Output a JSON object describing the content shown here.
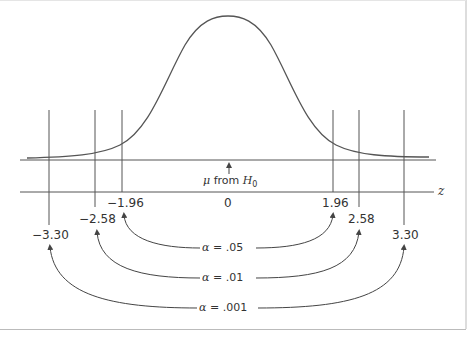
{
  "figure": {
    "axis_label": "z",
    "center_label_mu": "μ",
    "center_label_from": " from ",
    "center_label_H": "H",
    "center_label_sub": "0",
    "center_tick": "0"
  },
  "critical_values": {
    "neg_196": "−1.96",
    "neg_258": "−2.58",
    "neg_330": "−3.30",
    "pos_196": "1.96",
    "pos_258": "2.58",
    "pos_330": "3.30"
  },
  "alphas": {
    "a05": {
      "symbol": "α",
      "value": " = .05"
    },
    "a01": {
      "symbol": "α",
      "value": " = .01"
    },
    "a001": {
      "symbol": "α",
      "value": " = .001"
    }
  },
  "colors": {
    "line": "#555555",
    "text": "#333333",
    "border": "#bbbbbb"
  }
}
